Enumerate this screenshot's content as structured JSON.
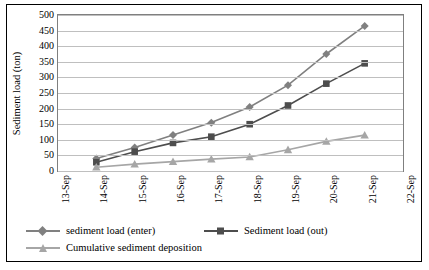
{
  "chart_data": {
    "type": "line",
    "title": "",
    "xlabel": "",
    "ylabel": "Sediment load (ton)",
    "x": [
      "13-Sep",
      "14-Sep",
      "15-Sep",
      "16-Sep",
      "17-Sep",
      "18-Sep",
      "19-Sep",
      "20-Sep",
      "21-Sep",
      "22-Sep"
    ],
    "categories": [
      "13-Sep",
      "14-Sep",
      "15-Sep",
      "16-Sep",
      "17-Sep",
      "18-Sep",
      "19-Sep",
      "20-Sep",
      "21-Sep",
      "22-Sep"
    ],
    "ylim": [
      0,
      500
    ],
    "yticks": [
      0,
      50,
      100,
      150,
      200,
      250,
      300,
      350,
      400,
      450,
      500
    ],
    "grid": true,
    "legend_position": "bottom",
    "series": [
      {
        "name": "sediment load (enter)",
        "color": "#808080",
        "marker": "diamond",
        "x": [
          "14-Sep",
          "15-Sep",
          "16-Sep",
          "17-Sep",
          "18-Sep",
          "19-Sep",
          "20-Sep",
          "21-Sep"
        ],
        "values": [
          40,
          75,
          115,
          155,
          205,
          275,
          375,
          465
        ]
      },
      {
        "name": "Sediment load (out)",
        "color": "#4d4d4d",
        "marker": "square",
        "x": [
          "14-Sep",
          "15-Sep",
          "16-Sep",
          "17-Sep",
          "18-Sep",
          "19-Sep",
          "20-Sep",
          "21-Sep"
        ],
        "values": [
          28,
          62,
          90,
          110,
          150,
          210,
          280,
          345
        ]
      },
      {
        "name": "Cumulative sediment deposition",
        "color": "#a6a6a6",
        "marker": "triangle",
        "x": [
          "14-Sep",
          "15-Sep",
          "16-Sep",
          "17-Sep",
          "18-Sep",
          "19-Sep",
          "20-Sep",
          "21-Sep"
        ],
        "values": [
          12,
          22,
          30,
          38,
          45,
          68,
          95,
          115
        ]
      }
    ]
  }
}
